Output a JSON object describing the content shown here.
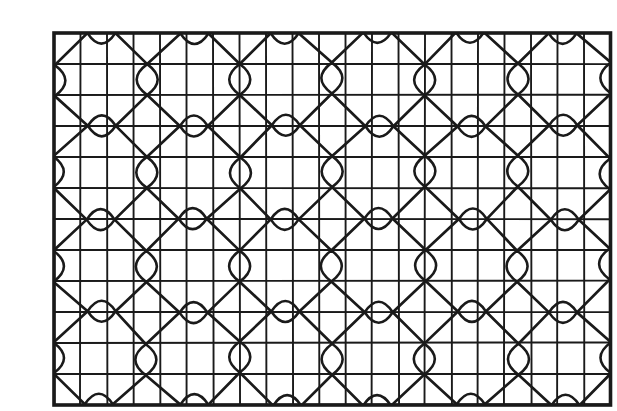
{
  "artwork": {
    "title": "geometric-lattice-pattern-plate",
    "description": "Hand-drawn black ink tessellation: rectangular grid overlaid with a diagonal diamond lattice; pointed-oval lens motifs sit at every diamond vertex, alternating horizontal and vertical orientation; half lenses appear along the borders.",
    "background_color": "#ffffff",
    "ink_color": "#1a1a1a",
    "canvas": {
      "width": 584,
      "height": 401
    },
    "frame": {
      "x": 14,
      "y": 17,
      "width": 556.5,
      "height": 372,
      "stroke_width": 3.6
    },
    "grid": {
      "columns": 21,
      "rows": 12,
      "cell_width": 26.5,
      "cell_height": 31,
      "stroke_width": 1.9
    },
    "lattice": {
      "period_x": 92.75,
      "period_y": 93,
      "h_node_cols": 6,
      "h_node_rows": 5,
      "v_node_cols": 7,
      "v_node_rows": 4,
      "stroke_width": 2.7,
      "jitter": 1.6
    },
    "lens": {
      "horizontal": {
        "half_span": 14,
        "half_height": 10.5
      },
      "vertical": {
        "half_span": 15.5,
        "half_width": 10.5
      },
      "stroke_width": 2.6
    }
  }
}
